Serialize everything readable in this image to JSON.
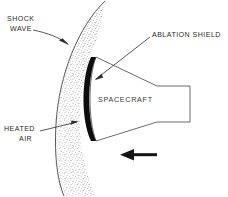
{
  "diagram": {
    "background_color": "#ffffff",
    "line_color": "#5a5a5a",
    "shield_color": "#0d0d0d",
    "text_color": "#2b2b2b",
    "labels": {
      "shock_wave_line1": "SHOCK",
      "shock_wave_line2": "WAVE",
      "ablation_shield": "ABLATION SHIELD",
      "heated_air_line1": "HEATED",
      "heated_air_line2": "AIR",
      "spacecraft": "SPACECRAFT"
    },
    "annotations": {
      "velocity_arrow_direction": "left",
      "shock_layer_fill": "stippled"
    }
  }
}
